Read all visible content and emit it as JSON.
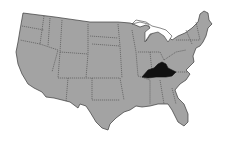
{
  "map": {
    "region": "Contiguous United States",
    "highlighted_state": "Kentucky",
    "colors": {
      "land": "#a3a3a3",
      "highlight": "#111111",
      "border": "#3a3a3a",
      "background": "#ffffff"
    }
  }
}
